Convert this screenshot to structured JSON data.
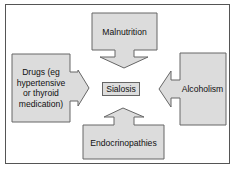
{
  "diagram": {
    "center": {
      "label": "Sialosis"
    },
    "causes": [
      {
        "id": "top",
        "label": "Malnutrition"
      },
      {
        "id": "left",
        "lines": [
          "Drugs (eg",
          "hypertensive",
          "or thyroid",
          "medication)"
        ]
      },
      {
        "id": "right",
        "label": "Alcoholism"
      },
      {
        "id": "bottom",
        "label": "Endocrinopathies"
      }
    ],
    "colors": {
      "fill": "#dcdcdc",
      "stroke": "#666666",
      "frame": "#555555"
    }
  }
}
